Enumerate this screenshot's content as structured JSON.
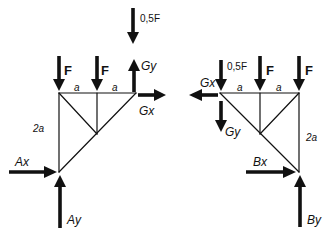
{
  "diagram": {
    "type": "free-body diagrams of two truss parts",
    "left_part": {
      "loads": [
        {
          "label": "F",
          "direction": "down",
          "at": "top-left joint"
        },
        {
          "label": "F",
          "direction": "down",
          "at": "top-middle joint"
        },
        {
          "label": "0,5F",
          "direction": "down",
          "at": "above hinge G (detached)"
        }
      ],
      "hinge_forces": [
        {
          "label": "Gy",
          "direction": "up"
        },
        {
          "label": "Gx",
          "direction": "right"
        }
      ],
      "support_reactions": [
        {
          "label": "Ax",
          "direction": "right"
        },
        {
          "label": "Ay",
          "direction": "up"
        }
      ],
      "dimensions": [
        "a",
        "a",
        "2a"
      ]
    },
    "right_part": {
      "loads": [
        {
          "label": "0,5F",
          "direction": "down",
          "at": "hinge G"
        },
        {
          "label": "F",
          "direction": "down",
          "at": "top-middle joint"
        },
        {
          "label": "F",
          "direction": "down",
          "at": "top-right joint"
        }
      ],
      "hinge_forces": [
        {
          "label": "Gx",
          "direction": "left"
        },
        {
          "label": "Gy",
          "direction": "down"
        }
      ],
      "support_reactions": [
        {
          "label": "Bx",
          "direction": "right"
        },
        {
          "label": "By",
          "direction": "up"
        }
      ],
      "dimensions": [
        "a",
        "a",
        "2a"
      ]
    }
  },
  "labels": {
    "left": {
      "half_f": "0,5F",
      "f1": "F",
      "f2": "F",
      "gy": "Gy",
      "gx": "Gx",
      "dim_a1": "a",
      "dim_a2": "a",
      "dim_2a": "2a",
      "ax": "Ax",
      "ay": "Ay"
    },
    "right": {
      "half_f": "0,5F",
      "f1": "F",
      "f2": "F",
      "gx": "Gx",
      "gy": "Gy",
      "dim_a1": "a",
      "dim_a2": "a",
      "dim_2a": "2a",
      "bx": "Bx",
      "by": "By"
    }
  },
  "colors": {
    "ink": "#111111",
    "background": "#ffffff"
  }
}
